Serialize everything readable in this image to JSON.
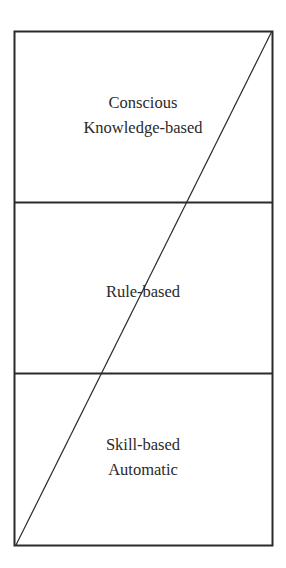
{
  "diagram": {
    "type": "layered-box-with-diagonal",
    "colors": {
      "line": "#2a2a2a",
      "text": "#2a2a2a",
      "background": "#ffffff"
    },
    "levels": [
      {
        "id": "top",
        "lines": [
          "Conscious",
          "Knowledge-based"
        ]
      },
      {
        "id": "middle",
        "lines": [
          "Rule-based"
        ]
      },
      {
        "id": "bottom",
        "lines": [
          "Skill-based",
          "Automatic"
        ]
      }
    ],
    "diagonal": {
      "from": "bottom-left",
      "to": "top-right"
    }
  }
}
